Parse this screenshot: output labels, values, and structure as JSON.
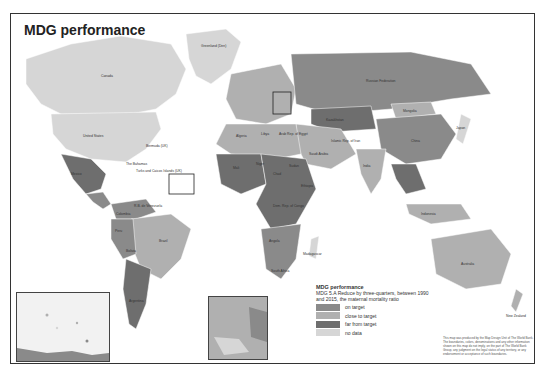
{
  "title": "MDG performance",
  "legend": {
    "title": "MDG performance",
    "description": "MDG 5.A Reduce by three-quarters, between 1990 and 2015, the maternal mortality ratio",
    "items": [
      {
        "label": "on target",
        "color": "#8a8a8a"
      },
      {
        "label": "close to target",
        "color": "#b0b0b0"
      },
      {
        "label": "far from target",
        "color": "#6e6e6e"
      },
      {
        "label": "no data",
        "color": "#d6d6d6"
      }
    ]
  },
  "note": "This map was produced by the Map Design Unit of The World Bank. The boundaries, colors, denominations and any other information shown on this map do not imply, on the part of The World Bank Group, any judgment on the legal status of any territory, or any endorsement or acceptance of such boundaries.",
  "labels": {
    "canada": "Canada",
    "united_states": "United States",
    "mexico": "Mexico",
    "bahamas": "The Bahamas",
    "turks": "Turks and Caicos Islands (UK)",
    "bermuda": "Bermuda (UK)",
    "greenland": "Greenland (Den)",
    "brazil": "Brazil",
    "peru": "Peru",
    "bolivia": "Bolivia",
    "argentina": "Argentina",
    "chile": "Chile",
    "colombia": "Colombia",
    "venezuela": "R.B. de Venezuela",
    "russia": "Russian Federation",
    "kazakhstan": "Kazakhstan",
    "mongolia": "Mongolia",
    "china": "China",
    "india": "India",
    "australia": "Australia",
    "indonesia": "Indonesia",
    "japan": "Japan",
    "algeria": "Algeria",
    "libya": "Libya",
    "egypt": "Arab Rep. of Egypt",
    "niger": "Niger",
    "mali": "Mali",
    "chad": "Chad",
    "sudan": "Sudan",
    "ethiopia": "Ethiopia",
    "drc": "Dem. Rep. of Congo",
    "angola": "Angola",
    "south_africa": "South Africa",
    "madagascar": "Madagascar",
    "saudi": "Saudi Arabia",
    "iran": "Islamic Rep. of Iran",
    "new_zealand": "New Zealand",
    "caribbean_inset": "Caribbean inset",
    "europe_inset": "Europe inset"
  }
}
